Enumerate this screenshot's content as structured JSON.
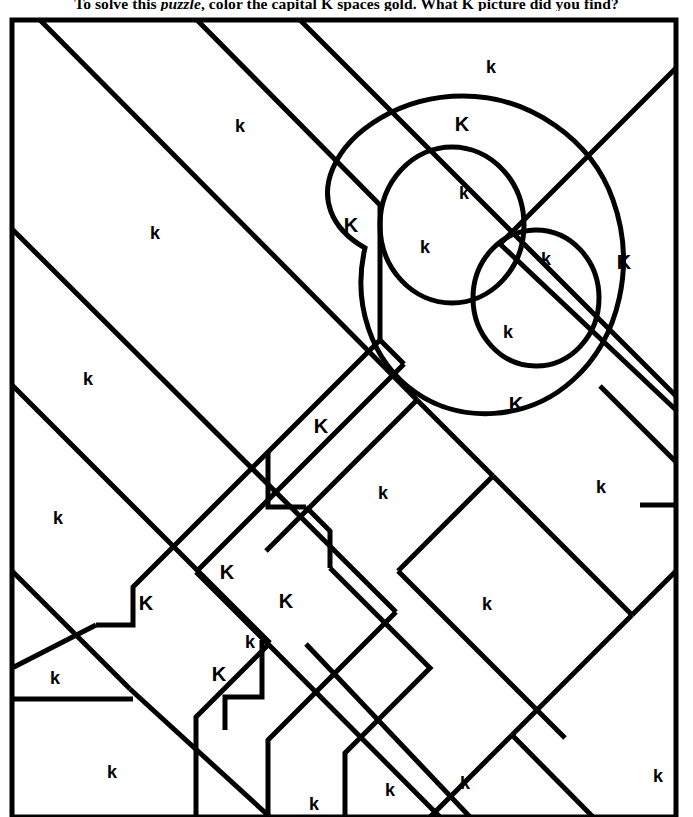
{
  "page": {
    "background_color": "#ffffff",
    "ink_color": "#000000",
    "width": 693,
    "height": 817
  },
  "instruction": {
    "prefix": "To solve this ",
    "emphasis": "puzzle",
    "suffix": ", color the capital K spaces gold. What K picture did you find?",
    "full_text": "To solve this puzzle, color the capital K spaces gold. What K picture did you find?"
  },
  "puzzle": {
    "answer_letter": "K",
    "fill_letter": "K",
    "fill_color_name": "gold",
    "hidden_picture": "key",
    "frame": {
      "x": 12,
      "y": 20,
      "width": 664,
      "height": 797
    },
    "stroke_width": 5,
    "labels": [
      {
        "id": "l01",
        "text": "k",
        "case": "lower",
        "x": 491,
        "y": 67
      },
      {
        "id": "l02",
        "text": "k",
        "case": "lower",
        "x": 240,
        "y": 126
      },
      {
        "id": "l03",
        "text": "K",
        "case": "upper",
        "x": 462,
        "y": 124
      },
      {
        "id": "l04",
        "text": "k",
        "case": "lower",
        "x": 464,
        "y": 193
      },
      {
        "id": "l05",
        "text": "K",
        "case": "upper",
        "x": 351,
        "y": 225
      },
      {
        "id": "l06",
        "text": "k",
        "case": "lower",
        "x": 155,
        "y": 233
      },
      {
        "id": "l07",
        "text": "k",
        "case": "lower",
        "x": 425,
        "y": 247
      },
      {
        "id": "l08",
        "text": "k",
        "case": "lower",
        "x": 546,
        "y": 259
      },
      {
        "id": "l09",
        "text": "K",
        "case": "upper",
        "x": 624,
        "y": 262
      },
      {
        "id": "l10",
        "text": "k",
        "case": "lower",
        "x": 88,
        "y": 379
      },
      {
        "id": "l11",
        "text": "k",
        "case": "lower",
        "x": 508,
        "y": 332
      },
      {
        "id": "l12",
        "text": "K",
        "case": "upper",
        "x": 516,
        "y": 404
      },
      {
        "id": "l13",
        "text": "K",
        "case": "upper",
        "x": 321,
        "y": 426
      },
      {
        "id": "l14",
        "text": "k",
        "case": "lower",
        "x": 58,
        "y": 518
      },
      {
        "id": "l15",
        "text": "K",
        "case": "upper",
        "x": 227,
        "y": 572
      },
      {
        "id": "l16",
        "text": "k",
        "case": "lower",
        "x": 383,
        "y": 493
      },
      {
        "id": "l17",
        "text": "k",
        "case": "lower",
        "x": 601,
        "y": 487
      },
      {
        "id": "l18",
        "text": "K",
        "case": "upper",
        "x": 146,
        "y": 603
      },
      {
        "id": "l19",
        "text": "K",
        "case": "upper",
        "x": 286,
        "y": 601
      },
      {
        "id": "l20",
        "text": "k",
        "case": "lower",
        "x": 487,
        "y": 604
      },
      {
        "id": "l21",
        "text": "k",
        "case": "lower",
        "x": 250,
        "y": 642
      },
      {
        "id": "l22",
        "text": "k",
        "case": "lower",
        "x": 55,
        "y": 678
      },
      {
        "id": "l23",
        "text": "K",
        "case": "upper",
        "x": 219,
        "y": 674
      },
      {
        "id": "l24",
        "text": "k",
        "case": "lower",
        "x": 112,
        "y": 772
      },
      {
        "id": "l25",
        "text": "k",
        "case": "lower",
        "x": 314,
        "y": 804
      },
      {
        "id": "l26",
        "text": "k",
        "case": "lower",
        "x": 390,
        "y": 790
      },
      {
        "id": "l27",
        "text": "k",
        "case": "lower",
        "x": 465,
        "y": 783
      },
      {
        "id": "l28",
        "text": "k",
        "case": "lower",
        "x": 658,
        "y": 776
      }
    ],
    "shapes": {
      "description": "Diagonal straight lines forming polygon regions, plus key head made of an outer rounded loop and two inner circles.",
      "key_head": {
        "outer_loop": "rounded outer outline of key bow",
        "inner_circle_upper": {
          "cx": 452,
          "cy": 225,
          "rx": 72,
          "ry": 78
        },
        "inner_circle_lower": {
          "cx": 536,
          "cy": 298,
          "rx": 63,
          "ry": 68
        }
      }
    }
  }
}
